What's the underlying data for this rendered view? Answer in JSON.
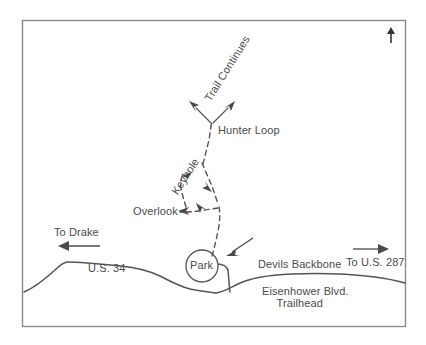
{
  "map": {
    "title": "Devils Backbone Trail Area Map",
    "compass": "N",
    "compass_icon": "north-arrow-icon",
    "colors": {
      "border": "#8a8a8a",
      "road": "#555555",
      "trail": "#555555",
      "text": "#4a4a4a",
      "background": "#ffffff"
    },
    "labels": {
      "trail_continues": "Trail Continues",
      "hunter_loop": "Hunter Loop",
      "keyhole": "Keyhole",
      "overlook": "Overlook",
      "park": "Park",
      "devils_backbone_trailhead_line1": "Devils Backbone",
      "devils_backbone_trailhead_line2": "Trailhead",
      "to_drake": "To Drake",
      "to_us_287": "To U.S. 287",
      "us_34": "U.S. 34",
      "eisenhower_blvd": "Eisenhower Blvd."
    },
    "features": {
      "roads": [
        "U.S. 34",
        "Eisenhower Blvd."
      ],
      "trails": [
        "Hunter Loop",
        "Keyhole",
        "Overlook",
        "Trail Continues"
      ],
      "points_of_interest": [
        "Park",
        "Devils Backbone Trailhead"
      ],
      "directions": [
        "To Drake",
        "To U.S. 287"
      ]
    }
  }
}
